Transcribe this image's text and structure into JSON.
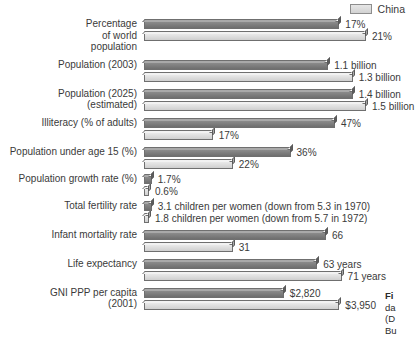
{
  "legend": {
    "items": [
      {
        "label": "China",
        "color": "#dcdcdc",
        "swatch_name": "legend-swatch-china"
      }
    ]
  },
  "caption": {
    "line1": "Fi",
    "line2": "da",
    "line3": "(D",
    "line4": "Bu"
  },
  "chart_data": {
    "type": "bar",
    "orientation": "horizontal",
    "title": "",
    "xlabel": "",
    "ylabel": "",
    "grid": false,
    "legend_position": "top-right",
    "note": "Paired horizontal 3-D bars; each indicator row is scaled independently to its own maximum. Upper (dark grey) bar = India, lower (light grey) bar = China.",
    "series": [
      {
        "name": "India",
        "color": "#7a7a7a"
      },
      {
        "name": "China",
        "color": "#dcdcdc"
      }
    ],
    "categories": [
      "Percentage\nof world\npopulation",
      "Population (2003)",
      "Population (2025)\n(estimated)",
      "Illiteracy (% of adults)",
      "Population under age 15 (%)",
      "Population growth rate (%)",
      "Total fertility rate",
      "Infant mortality rate",
      "Life expectancy",
      "GNI PPP per capita\n(2001)"
    ],
    "rows": [
      {
        "label": "Percentage\nof world\npopulation",
        "bars": [
          {
            "series": "India",
            "value": 17,
            "display": "17%",
            "length_pct": 88
          },
          {
            "series": "China",
            "value": 21,
            "display": "21%",
            "length_pct": 100
          }
        ]
      },
      {
        "label": "Population (2003)",
        "bars": [
          {
            "series": "India",
            "value": 1.1,
            "display": "1.1 billion",
            "length_pct": 83
          },
          {
            "series": "China",
            "value": 1.3,
            "display": "1.3 billion",
            "length_pct": 94
          }
        ]
      },
      {
        "label": "Population (2025)\n(estimated)",
        "bars": [
          {
            "series": "India",
            "value": 1.4,
            "display": "1.4 billion",
            "length_pct": 94
          },
          {
            "series": "China",
            "value": 1.5,
            "display": "1.5 billion",
            "length_pct": 100
          }
        ]
      },
      {
        "label": "Illiteracy (% of adults)",
        "bars": [
          {
            "series": "India",
            "value": 47,
            "display": "47%",
            "length_pct": 86
          },
          {
            "series": "China",
            "value": 17,
            "display": "17%",
            "length_pct": 31
          }
        ]
      },
      {
        "label": "Population under age 15 (%)",
        "bars": [
          {
            "series": "India",
            "value": 36,
            "display": "36%",
            "length_pct": 66
          },
          {
            "series": "China",
            "value": 22,
            "display": "22%",
            "length_pct": 40
          }
        ]
      },
      {
        "label": "Population growth rate (%)",
        "bars": [
          {
            "series": "India",
            "value": 1.7,
            "display": "1.7%",
            "length_pct": 3.5
          },
          {
            "series": "China",
            "value": 0.6,
            "display": "0.6%",
            "length_pct": 1.6
          }
        ]
      },
      {
        "label": "Total fertility rate",
        "bars": [
          {
            "series": "India",
            "value": 3.1,
            "display": "3.1 children per women (down from 5.3 in 1970)",
            "length_pct": 3.5
          },
          {
            "series": "China",
            "value": 1.8,
            "display": "1.8 children per women (down from 5.7 in 1972)",
            "length_pct": 2.2
          }
        ]
      },
      {
        "label": "Infant mortality rate",
        "bars": [
          {
            "series": "India",
            "value": 66,
            "display": "66",
            "length_pct": 82
          },
          {
            "series": "China",
            "value": 31,
            "display": "31",
            "length_pct": 40
          }
        ]
      },
      {
        "label": "Life expectancy",
        "bars": [
          {
            "series": "India",
            "value": 63,
            "display": "63 years",
            "length_pct": 78
          },
          {
            "series": "China",
            "value": 71,
            "display": "71 years",
            "length_pct": 89
          }
        ]
      },
      {
        "label": "GNI PPP per capita\n(2001)",
        "bars": [
          {
            "series": "India",
            "value": 2820,
            "display": "$2,820",
            "length_pct": 63
          },
          {
            "series": "China",
            "value": 3950,
            "display": "$3,950",
            "length_pct": 88
          }
        ]
      }
    ]
  }
}
